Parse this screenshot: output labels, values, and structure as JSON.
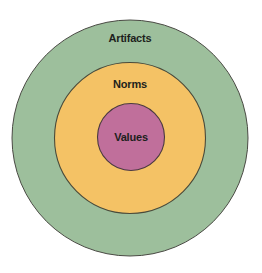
{
  "diagram": {
    "type": "concentric-circles",
    "layers": [
      {
        "id": "artifacts",
        "label": "Artifacts",
        "color": "#9dbf9c",
        "level": "outer"
      },
      {
        "id": "norms",
        "label": "Norms",
        "color": "#f4c265",
        "level": "middle"
      },
      {
        "id": "values",
        "label": "Values",
        "color": "#c06f9b",
        "level": "inner"
      }
    ],
    "border_color": "#4a4a44",
    "text_color": "#1d1f1c"
  }
}
